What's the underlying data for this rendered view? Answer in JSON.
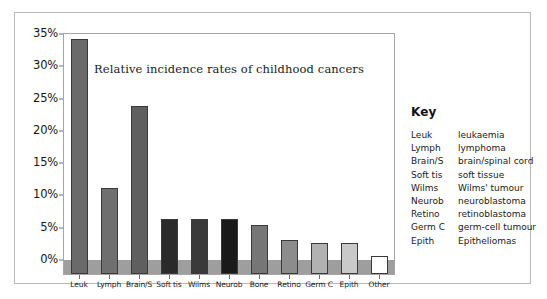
{
  "figure": {
    "title": "Relative incidence rates of childhood cancers"
  },
  "key": {
    "heading": "Key",
    "entries": [
      {
        "abbr": "Leuk",
        "full": "leukaemia"
      },
      {
        "abbr": "Lymph",
        "full": "lymphoma"
      },
      {
        "abbr": "Brain/S",
        "full": "brain/spinal cord"
      },
      {
        "abbr": "Soft tis",
        "full": "soft tissue"
      },
      {
        "abbr": "Wilms",
        "full": "Wilms' tumour"
      },
      {
        "abbr": "Neurob",
        "full": "neuroblastoma"
      },
      {
        "abbr": "Retino",
        "full": "retinoblastoma"
      },
      {
        "abbr": "Germ C",
        "full": "germ-cell tumour"
      },
      {
        "abbr": "Epith",
        "full": "Epitheliomas"
      }
    ]
  },
  "chart_data": {
    "type": "bar",
    "title": "Relative incidence rates of childhood cancers",
    "xlabel": "",
    "ylabel": "",
    "ylim": [
      0,
      35
    ],
    "ytick_labels": [
      "0%",
      "5%",
      "10%",
      "15%",
      "20%",
      "25%",
      "30%",
      "35%"
    ],
    "ytick_values": [
      0,
      5,
      10,
      15,
      20,
      25,
      30,
      35
    ],
    "grid": false,
    "legend_position": "right",
    "categories": [
      "Leuk",
      "Lymph",
      "Brain/S",
      "Soft tis",
      "Wilms",
      "Neurob",
      "Bone",
      "Retino",
      "Germ C",
      "Epith",
      "Other"
    ],
    "values": [
      34.3,
      11.1,
      23.8,
      6.3,
      6.3,
      6.3,
      5.4,
      3.1,
      2.7,
      2.6,
      0.6
    ],
    "bar_colors": [
      "#6a6a6a",
      "#6f6f6f",
      "#5f5f5f",
      "#2a2a2a",
      "#3a3a3a",
      "#1a1a1a",
      "#767676",
      "#8c8c8c",
      "#b2b2b2",
      "#c9c9c9",
      "#ffffff"
    ],
    "bar_edge_color": "#3a3a3a",
    "floor_band_color": "#9e9e9e",
    "panel_background": "#ffffff",
    "axis_color": "#6f6f6f"
  }
}
